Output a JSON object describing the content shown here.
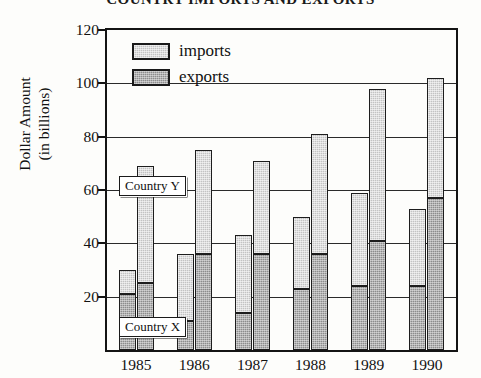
{
  "title": "COUNTRY IMPORTS AND EXPORTS",
  "axes": {
    "ylabel_line1": "Dollar Amount",
    "ylabel_line2": "(in billions)",
    "yticks": [
      0,
      20,
      40,
      60,
      80,
      100,
      120
    ],
    "ytick_labels": [
      "",
      "20",
      "40",
      "60",
      "80",
      "100",
      "120"
    ],
    "xlabel": ""
  },
  "legend": {
    "position": "top-left-inside",
    "items": [
      {
        "label": "imports",
        "color": "#c3c3c3",
        "name": "imports"
      },
      {
        "label": "exports",
        "color": "#8d8d8d",
        "name": "exports"
      }
    ]
  },
  "callouts": {
    "country_y": "Country Y",
    "country_x": "Country X"
  },
  "chart_data": {
    "type": "bar",
    "title": "COUNTRY IMPORTS AND EXPORTS",
    "subtitle": "",
    "xlabel": "",
    "ylabel": "Dollar Amount (in billions)",
    "ylim": [
      0,
      120
    ],
    "ytick_step": 20,
    "grid": true,
    "stacked": true,
    "stack_note": "Each bar total = imports; the shaded lower portion = exports",
    "categories": [
      "1985",
      "1986",
      "1987",
      "1988",
      "1989",
      "1990"
    ],
    "groups": [
      {
        "name": "Country X",
        "bar_order": 1,
        "series": [
          {
            "name": "imports",
            "values": [
              30,
              36,
              43,
              50,
              59,
              53
            ]
          },
          {
            "name": "exports",
            "values": [
              21,
              11,
              14,
              23,
              24,
              24
            ]
          }
        ]
      },
      {
        "name": "Country Y",
        "bar_order": 2,
        "series": [
          {
            "name": "imports",
            "values": [
              69,
              75,
              71,
              81,
              98,
              102
            ]
          },
          {
            "name": "exports",
            "values": [
              25,
              36,
              36,
              36,
              41,
              57
            ]
          }
        ]
      }
    ]
  }
}
